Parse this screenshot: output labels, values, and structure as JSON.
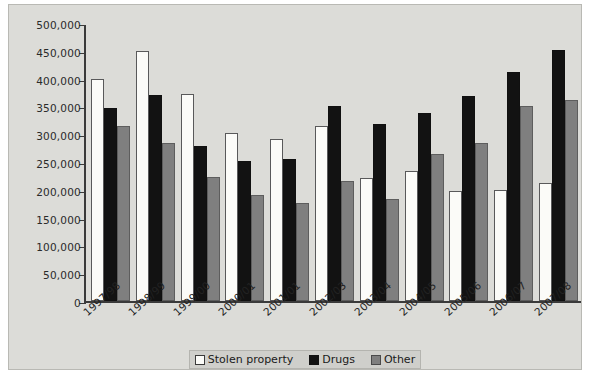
{
  "chart_data": {
    "type": "bar",
    "title": "",
    "xlabel": "",
    "ylabel": "",
    "ylim": [
      0,
      500000
    ],
    "ytick_values": [
      0,
      50000,
      100000,
      150000,
      200000,
      250000,
      300000,
      350000,
      400000,
      450000,
      500000
    ],
    "ytick_labels": [
      "0",
      "50,000",
      "100,000",
      "150,000",
      "200,000",
      "250,000",
      "300,000",
      "350,000",
      "400,000",
      "450,000",
      "500,000"
    ],
    "grid": false,
    "legend_position": "bottom-center",
    "categories": [
      "1997/98",
      "1998/99",
      "1999/00",
      "2000/01",
      "2001/01",
      "2002/03",
      "2003/04",
      "2004/05",
      "2005/06",
      "2006/07",
      "2007/08"
    ],
    "series": [
      {
        "name": "Stolen property",
        "color": "#fbfbf8",
        "values": [
          400000,
          450000,
          372000,
          302000,
          291000,
          315000,
          222000,
          233000,
          198000,
          199000,
          212000
        ]
      },
      {
        "name": "Drugs",
        "color": "#121212",
        "values": [
          348000,
          371000,
          278000,
          252000,
          255000,
          350000,
          318000,
          339000,
          369000,
          411000,
          451000
        ]
      },
      {
        "name": "Other",
        "color": "#7f7f7f",
        "values": [
          314000,
          285000,
          223000,
          190000,
          177000,
          215000,
          183000,
          264000,
          285000,
          350000,
          361000
        ]
      }
    ]
  },
  "legend": {
    "items": [
      {
        "label": "Stolen property",
        "key": "stolen"
      },
      {
        "label": "Drugs",
        "key": "drugs"
      },
      {
        "label": "Other",
        "key": "other"
      }
    ]
  },
  "colors": {
    "page_background": "#dcdcd8",
    "axis": "#3a3a3a",
    "legend_background": "#cfcfcb"
  }
}
